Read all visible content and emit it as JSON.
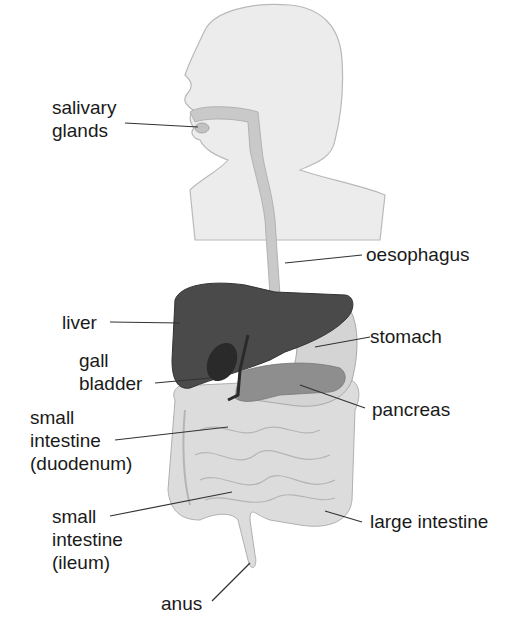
{
  "labels": {
    "salivary_glands": [
      "salivary",
      "glands"
    ],
    "oesophagus": "oesophagus",
    "liver": "liver",
    "stomach": "stomach",
    "gall_bladder": [
      "gall",
      "bladder"
    ],
    "pancreas": "pancreas",
    "small_intestine_duodenum": [
      "small",
      "intestine",
      "(duodenum)"
    ],
    "small_intestine_ileum": [
      "small",
      "intestine",
      "(ileum)"
    ],
    "large_intestine": "large intestine",
    "anus": "anus"
  },
  "colors": {
    "silhouette": "#ececec",
    "silhouette_outline": "#b9b9b9",
    "tract": "#c9c9c9",
    "liver": "#4a4a4a",
    "gall_bladder": "#2a2a2a",
    "stomach": "#d4d4d4",
    "pancreas": "#8e8e8e",
    "intestine": "#dcdcdc",
    "intestine_outline": "#b0b0b0",
    "leader_line": "#333333"
  }
}
